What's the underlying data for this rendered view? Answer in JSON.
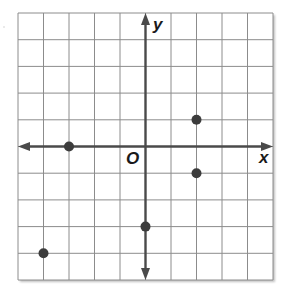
{
  "diagram": {
    "type": "coordinate-plane",
    "grid": {
      "columns": 10,
      "rows": 10,
      "x_range": [
        -5,
        5
      ],
      "y_range": [
        -5,
        5
      ],
      "line_color": "#8c8c8c",
      "border_color": "#8c8c8c"
    },
    "axes": {
      "x_label": "x",
      "y_label": "y",
      "origin_label": "O",
      "color": "#4a4a4a"
    },
    "points": [
      {
        "x": 2,
        "y": 1
      },
      {
        "x": -3,
        "y": 0
      },
      {
        "x": 2,
        "y": -1
      },
      {
        "x": 0,
        "y": -3
      },
      {
        "x": -4,
        "y": -4
      }
    ],
    "point_color": "#3c3c3c"
  },
  "chart_data": {
    "type": "scatter",
    "title": "",
    "xlabel": "x",
    "ylabel": "y",
    "xlim": [
      -5,
      5
    ],
    "ylim": [
      -5,
      5
    ],
    "grid": true,
    "series": [
      {
        "name": "points",
        "x": [
          2,
          -3,
          2,
          0,
          -4
        ],
        "y": [
          1,
          0,
          -1,
          -3,
          -4
        ]
      }
    ]
  }
}
